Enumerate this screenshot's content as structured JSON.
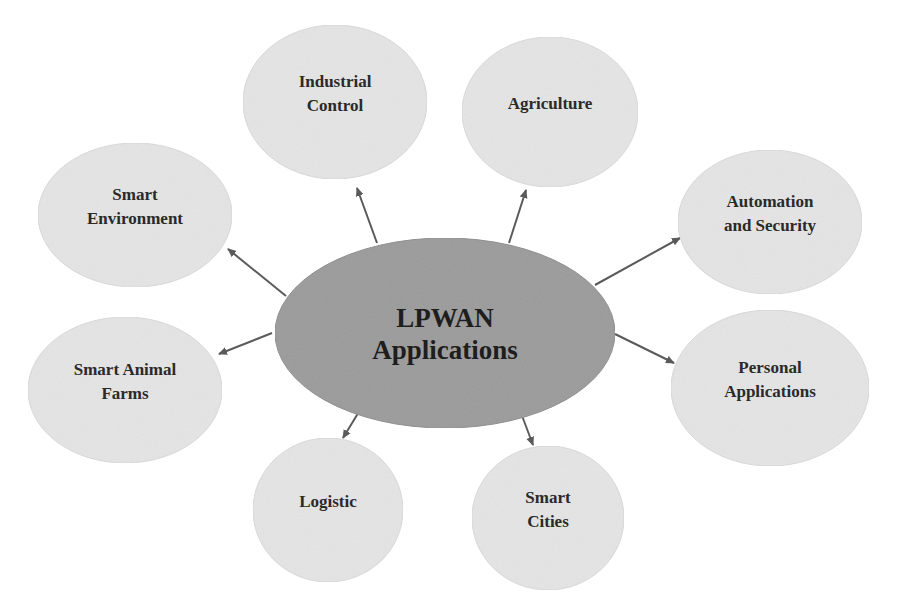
{
  "diagram": {
    "type": "hub-and-spoke",
    "colors": {
      "background": "#ffffff",
      "center_fill": "#9a9a9a",
      "center_stroke": "#8a8a8a",
      "node_fill": "#e6e6e6",
      "node_stroke": "#dadada",
      "arrow": "#5a5a5a",
      "text": "#2a2a2a"
    },
    "center": {
      "line1": "LPWAN",
      "line2": "Applications",
      "cx": 445,
      "cy": 333,
      "rx": 170,
      "ry": 95
    },
    "nodes": [
      {
        "id": "industrial-control",
        "lines": [
          "Industrial",
          "Control"
        ],
        "cx": 335,
        "cy": 102,
        "rx": 92,
        "ry": 77
      },
      {
        "id": "agriculture",
        "lines": [
          "Agriculture"
        ],
        "cx": 550,
        "cy": 112,
        "rx": 88,
        "ry": 75
      },
      {
        "id": "smart-environment",
        "lines": [
          "Smart",
          "Environment"
        ],
        "cx": 135,
        "cy": 215,
        "rx": 97,
        "ry": 72
      },
      {
        "id": "automation-and-security",
        "lines": [
          "Automation",
          "and Security"
        ],
        "cx": 770,
        "cy": 222,
        "rx": 92,
        "ry": 72
      },
      {
        "id": "smart-animal-farms",
        "lines": [
          "Smart Animal",
          "Farms"
        ],
        "cx": 125,
        "cy": 390,
        "rx": 97,
        "ry": 73
      },
      {
        "id": "personal-applications",
        "lines": [
          "Personal",
          "Applications"
        ],
        "cx": 770,
        "cy": 388,
        "rx": 99,
        "ry": 78
      },
      {
        "id": "logistic",
        "lines": [
          "Logistic"
        ],
        "cx": 328,
        "cy": 510,
        "rx": 75,
        "ry": 72
      },
      {
        "id": "smart-cities",
        "lines": [
          "Smart",
          "Cities"
        ],
        "cx": 548,
        "cy": 518,
        "rx": 76,
        "ry": 72
      }
    ],
    "arrows": [
      {
        "to": "industrial-control",
        "x1": 377,
        "y1": 243,
        "x2": 357,
        "y2": 188
      },
      {
        "to": "agriculture",
        "x1": 509,
        "y1": 243,
        "x2": 526,
        "y2": 190
      },
      {
        "to": "smart-environment",
        "x1": 286,
        "y1": 296,
        "x2": 228,
        "y2": 249
      },
      {
        "to": "automation-and-security",
        "x1": 595,
        "y1": 285,
        "x2": 680,
        "y2": 238
      },
      {
        "to": "smart-animal-farms",
        "x1": 272,
        "y1": 333,
        "x2": 219,
        "y2": 354
      },
      {
        "to": "personal-applications",
        "x1": 615,
        "y1": 334,
        "x2": 674,
        "y2": 363
      },
      {
        "to": "logistic",
        "x1": 360,
        "y1": 410,
        "x2": 343,
        "y2": 438
      },
      {
        "to": "smart-cities",
        "x1": 521,
        "y1": 413,
        "x2": 533,
        "y2": 445
      }
    ]
  }
}
